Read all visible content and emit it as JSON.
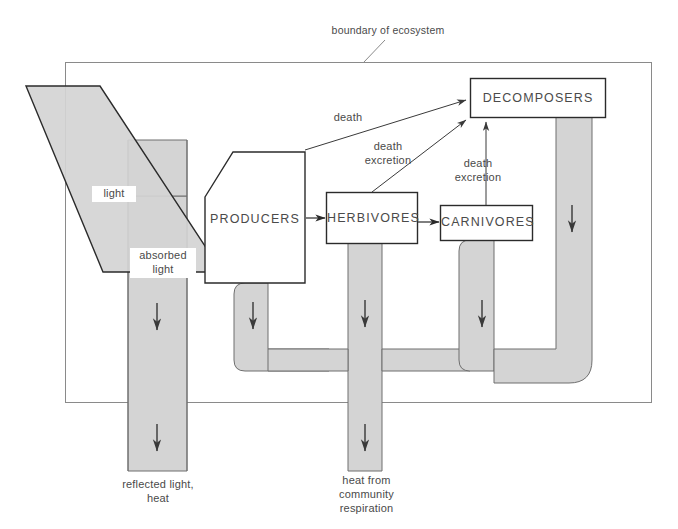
{
  "diagram": {
    "type": "energy-flow-diagram",
    "boundary_label": "boundary of ecosystem",
    "colors": {
      "band_fill": "#d4d4d4",
      "band_stroke": "#6f6f6f",
      "box_stroke": "#2b2b2b",
      "boundary_stroke": "#8a8a8a",
      "text": "#4a4a4a",
      "background": "#ffffff"
    },
    "boxes": [
      {
        "id": "producers",
        "label": "PRODUCERS"
      },
      {
        "id": "herbivores",
        "label": "HERBIVORES"
      },
      {
        "id": "carnivores",
        "label": "CARNIVORES"
      },
      {
        "id": "decomposers",
        "label": "DECOMPOSERS"
      }
    ],
    "beam_labels": [
      {
        "id": "light",
        "label": "light"
      },
      {
        "id": "absorbed-light",
        "label": "absorbed\nlight"
      }
    ],
    "flow_labels": [
      {
        "id": "death-producers",
        "label": "death"
      },
      {
        "id": "death-herbivores",
        "label": "death\nexcretion"
      },
      {
        "id": "death-carnivores",
        "label": "death\nexcretion"
      }
    ],
    "output_labels": [
      {
        "id": "reflected-light-heat",
        "label": "reflected light,\nheat"
      },
      {
        "id": "community-respiration",
        "label": "heat from\ncommunity\nrespiration"
      }
    ]
  }
}
